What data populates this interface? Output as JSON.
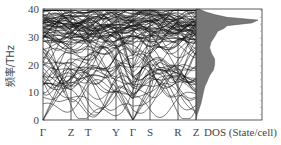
{
  "chart_data": [
    {
      "type": "line",
      "title": "",
      "subtitle": "Phonon dispersion",
      "xlabel": "",
      "ylabel": "频率/THz",
      "ylim": [
        0,
        40
      ],
      "yticks": [
        0,
        10,
        20,
        30,
        40
      ],
      "x_tick_labels": [
        "Γ",
        "Z",
        "T",
        "Y",
        "Γ",
        "S",
        "R",
        "Z"
      ],
      "grid": false,
      "legend": null,
      "series_description": "Dense set of ~100 phonon branches; acoustic branches start at 0 THz at Γ; optical branches densely cluster between ~30 and ~38 THz; bands span 0–40 THz.",
      "acoustic_branch_max_thz": 20
    },
    {
      "type": "area",
      "title": "",
      "xlabel": "DOS (State/cell)",
      "ylabel": "",
      "ylim": [
        0,
        40
      ],
      "orientation": "horizontal",
      "frequency_thz": [
        0,
        2,
        4,
        6,
        8,
        10,
        12,
        14,
        16,
        18,
        20,
        22,
        24,
        26,
        28,
        30,
        32,
        33,
        34,
        35,
        36,
        37,
        38,
        39,
        40
      ],
      "dos_relative": [
        0,
        0.02,
        0.05,
        0.08,
        0.1,
        0.12,
        0.14,
        0.18,
        0.22,
        0.28,
        0.3,
        0.3,
        0.25,
        0.22,
        0.24,
        0.3,
        0.35,
        0.45,
        0.5,
        0.9,
        1.0,
        0.5,
        0.3,
        0.15,
        0.05
      ],
      "peak_frequency_thz": 36,
      "fill_color": "#777777"
    }
  ],
  "labels": {
    "y_axis": "频率/THz",
    "y_ticks": [
      "0",
      "10",
      "20",
      "30",
      "40"
    ],
    "k_points": [
      "Γ",
      "Z",
      "T",
      "Y",
      "Γ",
      "S",
      "R",
      "Z"
    ],
    "dos_axis": "DOS (State/cell)"
  }
}
